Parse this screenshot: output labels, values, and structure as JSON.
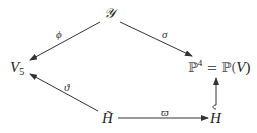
{
  "diagram": {
    "type": "commutative-diagram",
    "nodes": {
      "Y": {
        "label": "𝒴"
      },
      "V5": {
        "base": "V",
        "sub": "5"
      },
      "P4": {
        "base": "ℙ",
        "sup": "4",
        "eq": " = ℙ(",
        "var": "V",
        "close": ")"
      },
      "Htilde": {
        "label": "H̃"
      },
      "H": {
        "label": "H"
      }
    },
    "arrows": [
      {
        "from": "Y",
        "to": "V5",
        "label": "ϕ"
      },
      {
        "from": "Y",
        "to": "P4",
        "label": "σ"
      },
      {
        "from": "Htilde",
        "to": "V5",
        "label": "ϑ"
      },
      {
        "from": "Htilde",
        "to": "H",
        "label": "ϖ"
      },
      {
        "from": "H",
        "to": "P4",
        "label": "",
        "style": "hook"
      }
    ]
  }
}
